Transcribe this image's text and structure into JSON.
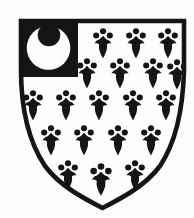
{
  "canvas": {
    "width": 194,
    "height": 218,
    "background": "#fcfcfc"
  },
  "palette": {
    "ink": "#151515",
    "field": "#fefefe"
  },
  "shield": {
    "path": "M 21 21 H 184 V 70 C 183 110 176 142 160 166 C 145 186 122 198 102.5 208 C 83 198 60 186 45 166 C 29 142 21 110 21 70 Z",
    "stroke_width": 4.6
  },
  "canton": {
    "x": 19,
    "y": 19,
    "width": 59,
    "height": 58
  },
  "crescent": {
    "outer": {
      "cx": 48.5,
      "cy": 48,
      "r": 21.8
    },
    "inner": {
      "cx": 49,
      "cy": 35,
      "r": 11.3
    }
  },
  "ermine": {
    "glyph": {
      "dots": [
        [
          0,
          3.2
        ],
        [
          -6.8,
          7.5
        ],
        [
          6.8,
          7.5
        ]
      ],
      "dot_radius": 3.05,
      "tail_path": "M 0 7.8 C -1.8 10.2 -3.6 11.6 -6.2 12.6 L -8.6 15.2 C -6.2 15.1 -4.6 15.6 -3.9 16.6 C -4.8 21 -2.7 25.6 0 30.4 C 2.7 25.6 4.8 21 3.9 16.6 C 4.6 15.6 6.2 15.1 8.6 15.2 L 6.2 12.6 C 3.6 11.6 1.8 10.2 0 7.8 Z"
    },
    "spots": [
      {
        "x": 103,
        "y": 28
      },
      {
        "x": 136,
        "y": 28
      },
      {
        "x": 168,
        "y": 28
      },
      {
        "x": 87,
        "y": 58
      },
      {
        "x": 120,
        "y": 58
      },
      {
        "x": 153,
        "y": 58
      },
      {
        "x": 177,
        "y": 59
      },
      {
        "x": 33,
        "y": 90
      },
      {
        "x": 66,
        "y": 90
      },
      {
        "x": 99,
        "y": 90
      },
      {
        "x": 133,
        "y": 90
      },
      {
        "x": 166,
        "y": 90
      },
      {
        "x": 51,
        "y": 125
      },
      {
        "x": 84,
        "y": 125
      },
      {
        "x": 118,
        "y": 125
      },
      {
        "x": 151,
        "y": 125
      },
      {
        "x": 68,
        "y": 160
      },
      {
        "x": 101,
        "y": 163,
        "s": 1.08
      },
      {
        "x": 135,
        "y": 160
      }
    ]
  }
}
